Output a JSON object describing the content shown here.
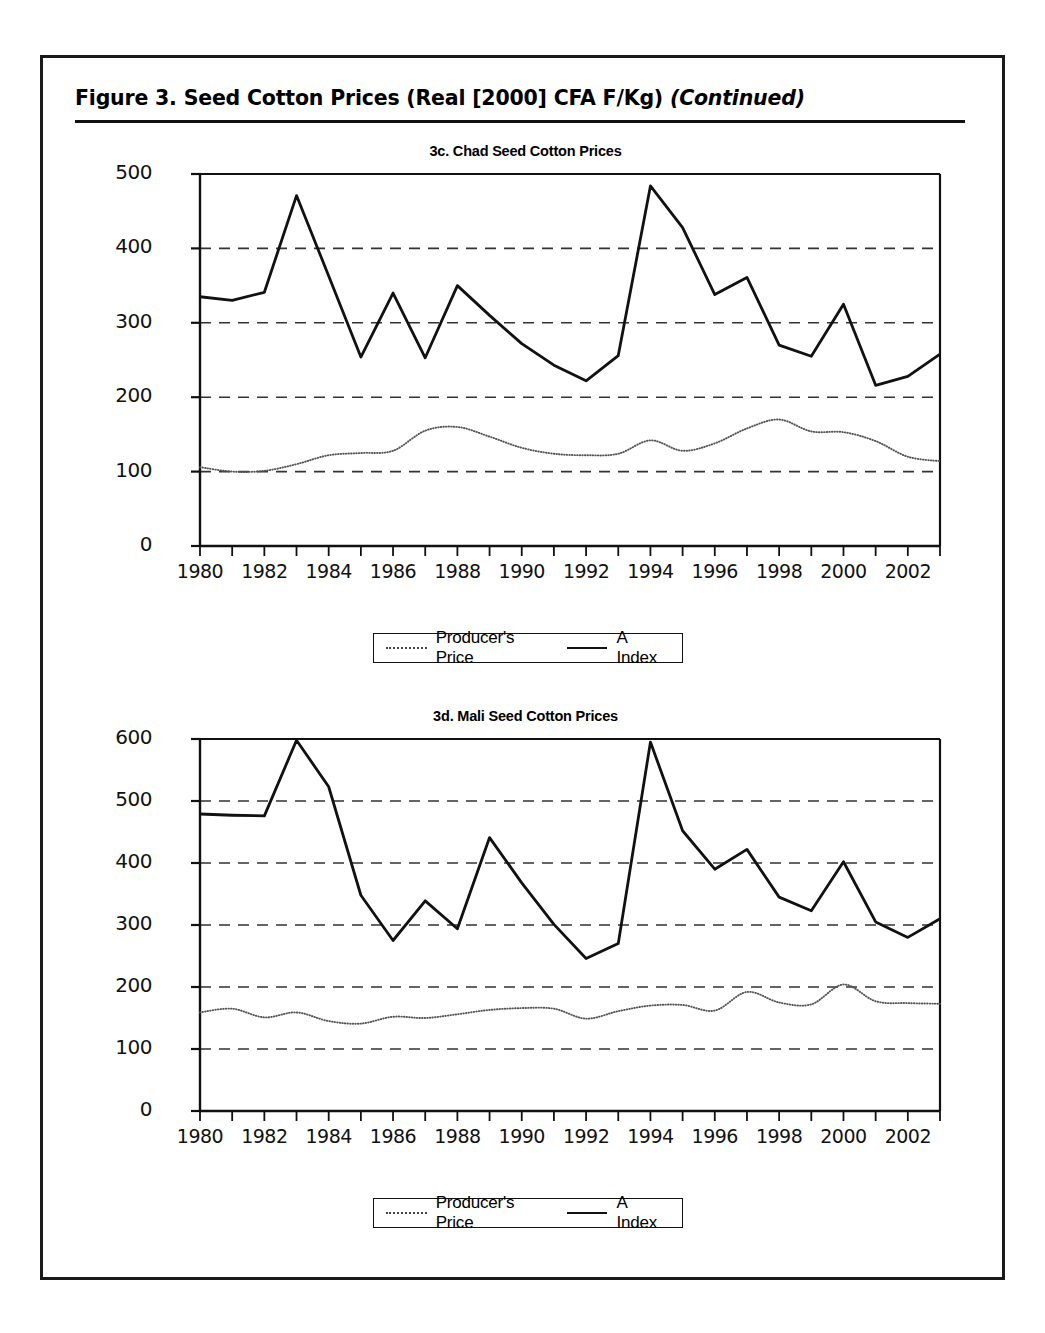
{
  "figure": {
    "title_main": "Figure 3.  Seed Cotton Prices (Real [2000] CFA F/Kg) ",
    "title_continued": "(Continued)"
  },
  "legend": {
    "producer_label": "Producer's Price",
    "aindex_label": "A Index",
    "producer_swatch": "dotted-line-swatch",
    "aindex_swatch": "solid-line-swatch"
  },
  "chart_data": [
    {
      "id": "3c",
      "type": "line",
      "title": "3c. Chad Seed Cotton Prices",
      "xlabel": "",
      "ylabel": "",
      "xlim": [
        1980,
        2003
      ],
      "ylim": [
        0,
        500
      ],
      "yticks": [
        0,
        100,
        200,
        300,
        400,
        500
      ],
      "ytick_labels": [
        "0",
        "100",
        "200",
        "300",
        "400",
        "500"
      ],
      "xticks": [
        1980,
        1981,
        1982,
        1983,
        1984,
        1985,
        1986,
        1987,
        1988,
        1989,
        1990,
        1991,
        1992,
        1993,
        1994,
        1995,
        1996,
        1997,
        1998,
        1999,
        2000,
        2001,
        2002,
        2003
      ],
      "xtick_labels_shown": [
        "1980",
        "1982",
        "1984",
        "1986",
        "1988",
        "1990",
        "1992",
        "1994",
        "1996",
        "1998",
        "2000",
        "2002"
      ],
      "grid": "horizontal-dashed",
      "legend_position": "below-center",
      "x": [
        1980,
        1981,
        1982,
        1983,
        1984,
        1985,
        1986,
        1987,
        1988,
        1989,
        1990,
        1991,
        1992,
        1993,
        1994,
        1995,
        1996,
        1997,
        1998,
        1999,
        2000,
        2001,
        2002,
        2003
      ],
      "series": [
        {
          "name": "A Index",
          "style": "solid",
          "values": [
            335,
            330,
            341,
            471,
            363,
            254,
            340,
            253,
            350,
            310,
            272,
            243,
            222,
            256,
            484,
            428,
            338,
            361,
            270,
            255,
            325,
            216,
            228,
            258
          ]
        },
        {
          "name": "Producer's Price",
          "style": "dotted",
          "values": [
            106,
            100,
            101,
            110,
            122,
            125,
            128,
            155,
            160,
            147,
            132,
            124,
            122,
            124,
            142,
            128,
            138,
            158,
            170,
            154,
            153,
            141,
            120,
            114
          ]
        }
      ]
    },
    {
      "id": "3d",
      "type": "line",
      "title": "3d. Mali Seed Cotton Prices",
      "xlabel": "",
      "ylabel": "",
      "xlim": [
        1980,
        2003
      ],
      "ylim": [
        0,
        600
      ],
      "yticks": [
        0,
        100,
        200,
        300,
        400,
        500,
        600
      ],
      "ytick_labels": [
        "0",
        "100",
        "200",
        "300",
        "400",
        "500",
        "600"
      ],
      "xticks": [
        1980,
        1981,
        1982,
        1983,
        1984,
        1985,
        1986,
        1987,
        1988,
        1989,
        1990,
        1991,
        1992,
        1993,
        1994,
        1995,
        1996,
        1997,
        1998,
        1999,
        2000,
        2001,
        2002,
        2003
      ],
      "xtick_labels_shown": [
        "1980",
        "1982",
        "1984",
        "1986",
        "1988",
        "1990",
        "1992",
        "1994",
        "1996",
        "1998",
        "2000",
        "2002"
      ],
      "grid": "horizontal-dashed",
      "legend_position": "below-center",
      "x": [
        1980,
        1981,
        1982,
        1983,
        1984,
        1985,
        1986,
        1987,
        1988,
        1989,
        1990,
        1991,
        1992,
        1993,
        1994,
        1995,
        1996,
        1997,
        1998,
        1999,
        2000,
        2001,
        2002,
        2003
      ],
      "series": [
        {
          "name": "A Index",
          "style": "solid",
          "values": [
            479,
            477,
            476,
            598,
            523,
            348,
            275,
            339,
            294,
            441,
            368,
            301,
            246,
            270,
            595,
            452,
            390,
            422,
            345,
            323,
            402,
            305,
            280,
            310
          ]
        },
        {
          "name": "Producer's Price",
          "style": "dotted",
          "values": [
            159,
            165,
            151,
            159,
            145,
            141,
            152,
            150,
            156,
            163,
            166,
            165,
            149,
            161,
            170,
            171,
            162,
            192,
            175,
            172,
            204,
            177,
            174,
            173
          ]
        }
      ]
    }
  ]
}
